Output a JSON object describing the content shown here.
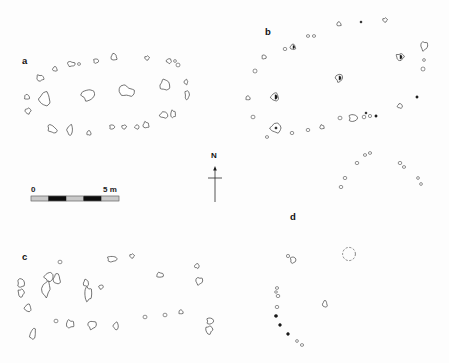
{
  "figure": {
    "kind": "archaeological-site-plan",
    "background_color": "#fdfdfd",
    "outline_color": "#3a3a3a",
    "fill_color": "#ffffff",
    "solid_color": "#1a1a1a"
  },
  "panels": [
    {
      "id": "a",
      "label": "a",
      "label_x": 22,
      "label_y": 64
    },
    {
      "id": "b",
      "label": "b",
      "label_x": 265,
      "label_y": 35
    },
    {
      "id": "c",
      "label": "c",
      "label_x": 22,
      "label_y": 260
    },
    {
      "id": "d",
      "label": "d",
      "label_x": 290,
      "label_y": 220
    }
  ],
  "north_arrow": {
    "label": "N",
    "label_x": 214,
    "label_y": 158,
    "line_x": 215,
    "line_top": 166,
    "line_bottom": 202,
    "cross_y": 178,
    "cross_half_width": 7
  },
  "scale_bar": {
    "left_label": "0",
    "right_label": "5 m",
    "unit": "m",
    "min": 0,
    "max": 5,
    "x": 31,
    "y": 196,
    "width": 88,
    "height": 5,
    "segments": 5,
    "segment_colors": [
      "#c9c9c9",
      "#0d0d0d",
      "#c9c9c9",
      "#0d0d0d",
      "#c9c9c9"
    ],
    "label_left_x": 31,
    "label_right_x": 103,
    "label_y": 192
  },
  "features": {
    "a": [
      {
        "cx": 114,
        "cy": 57,
        "rx": 3.0,
        "ry": 3.3,
        "rot": 0,
        "style": "outline"
      },
      {
        "cx": 96,
        "cy": 61,
        "rx": 2.4,
        "ry": 2.2,
        "rot": 0,
        "style": "outline"
      },
      {
        "cx": 147,
        "cy": 58,
        "rx": 2.2,
        "ry": 2.0,
        "rot": 0,
        "style": "outline"
      },
      {
        "cx": 169,
        "cy": 61,
        "rx": 2.6,
        "ry": 2.2,
        "rot": 15,
        "style": "outline"
      },
      {
        "cx": 175,
        "cy": 61,
        "rx": 1.4,
        "ry": 1.4,
        "rot": 0,
        "style": "outline"
      },
      {
        "cx": 71,
        "cy": 64,
        "rx": 3.6,
        "ry": 2.4,
        "rot": 10,
        "style": "outline"
      },
      {
        "cx": 79,
        "cy": 64,
        "rx": 1.5,
        "ry": 1.4,
        "rot": 0,
        "style": "outline"
      },
      {
        "cx": 55,
        "cy": 69,
        "rx": 2.4,
        "ry": 2.2,
        "rot": 0,
        "style": "outline"
      },
      {
        "cx": 178,
        "cy": 65,
        "rx": 2.0,
        "ry": 1.9,
        "rot": 0,
        "style": "outline"
      },
      {
        "cx": 40,
        "cy": 78,
        "rx": 3.4,
        "ry": 3.0,
        "rot": 20,
        "style": "outline"
      },
      {
        "cx": 186,
        "cy": 82,
        "rx": 1.8,
        "ry": 2.4,
        "rot": 0,
        "style": "outline"
      },
      {
        "cx": 165,
        "cy": 85,
        "rx": 5.0,
        "ry": 5.2,
        "rot": 0,
        "style": "outline"
      },
      {
        "cx": 126,
        "cy": 91,
        "rx": 7.8,
        "ry": 5.0,
        "rot": 20,
        "style": "outline"
      },
      {
        "cx": 88,
        "cy": 95,
        "rx": 6.4,
        "ry": 5.4,
        "rot": 0,
        "style": "outline"
      },
      {
        "cx": 45,
        "cy": 99,
        "rx": 5.6,
        "ry": 6.6,
        "rot": 0,
        "style": "outline"
      },
      {
        "cx": 27,
        "cy": 97,
        "rx": 2.6,
        "ry": 2.4,
        "rot": 0,
        "style": "outline"
      },
      {
        "cx": 187,
        "cy": 95,
        "rx": 2.0,
        "ry": 4.6,
        "rot": 0,
        "style": "outline"
      },
      {
        "cx": 28,
        "cy": 111,
        "rx": 2.8,
        "ry": 2.8,
        "rot": 0,
        "style": "outline"
      },
      {
        "cx": 164,
        "cy": 115,
        "rx": 4.2,
        "ry": 3.0,
        "rot": 0,
        "style": "outline"
      },
      {
        "cx": 173,
        "cy": 114,
        "rx": 2.4,
        "ry": 3.6,
        "rot": 0,
        "style": "outline"
      },
      {
        "cx": 52,
        "cy": 129,
        "rx": 5.0,
        "ry": 3.2,
        "rot": 40,
        "style": "outline"
      },
      {
        "cx": 70,
        "cy": 130,
        "rx": 2.8,
        "ry": 5.0,
        "rot": 5,
        "style": "outline"
      },
      {
        "cx": 89,
        "cy": 133,
        "rx": 2.2,
        "ry": 2.2,
        "rot": 0,
        "style": "outline"
      },
      {
        "cx": 112,
        "cy": 127,
        "rx": 2.4,
        "ry": 2.2,
        "rot": 0,
        "style": "outline"
      },
      {
        "cx": 124,
        "cy": 127,
        "rx": 2.2,
        "ry": 2.0,
        "rot": 0,
        "style": "outline"
      },
      {
        "cx": 137,
        "cy": 127,
        "rx": 2.2,
        "ry": 2.0,
        "rot": 0,
        "style": "outline"
      },
      {
        "cx": 146,
        "cy": 125,
        "rx": 3.0,
        "ry": 3.0,
        "rot": 0,
        "style": "outline"
      }
    ],
    "b": [
      {
        "cx": 339,
        "cy": 24,
        "rx": 2.2,
        "ry": 2.0,
        "rot": 0,
        "style": "outline"
      },
      {
        "cx": 361,
        "cy": 22,
        "rx": 1.0,
        "ry": 1.0,
        "rot": 0,
        "style": "solid"
      },
      {
        "cx": 385,
        "cy": 20,
        "rx": 2.2,
        "ry": 2.0,
        "rot": 0,
        "style": "outline"
      },
      {
        "cx": 308,
        "cy": 36,
        "rx": 1.6,
        "ry": 1.4,
        "rot": 0,
        "style": "outline"
      },
      {
        "cx": 314,
        "cy": 36,
        "rx": 1.6,
        "ry": 1.4,
        "rot": 0,
        "style": "outline"
      },
      {
        "cx": 424,
        "cy": 46,
        "rx": 3.2,
        "ry": 4.4,
        "rot": 0,
        "style": "outline"
      },
      {
        "cx": 285,
        "cy": 49,
        "rx": 1.8,
        "ry": 1.6,
        "rot": 0,
        "style": "outline"
      },
      {
        "cx": 293,
        "cy": 47,
        "rx": 2.8,
        "ry": 2.6,
        "rot": 0,
        "style": "halffill"
      },
      {
        "cx": 264,
        "cy": 57,
        "rx": 2.2,
        "ry": 2.0,
        "rot": 0,
        "style": "outline"
      },
      {
        "cx": 400,
        "cy": 57,
        "rx": 3.6,
        "ry": 3.4,
        "rot": 0,
        "style": "halffill"
      },
      {
        "cx": 424,
        "cy": 60,
        "rx": 1.4,
        "ry": 1.4,
        "rot": 0,
        "style": "outline"
      },
      {
        "cx": 255,
        "cy": 71,
        "rx": 2.0,
        "ry": 2.0,
        "rot": 0,
        "style": "outline"
      },
      {
        "cx": 423,
        "cy": 69,
        "rx": 2.0,
        "ry": 2.0,
        "rot": 0,
        "style": "outline"
      },
      {
        "cx": 339,
        "cy": 78,
        "rx": 3.4,
        "ry": 3.8,
        "rot": 0,
        "style": "halffill"
      },
      {
        "cx": 275,
        "cy": 97,
        "rx": 4.0,
        "ry": 3.8,
        "rot": 0,
        "style": "halffill"
      },
      {
        "cx": 248,
        "cy": 98,
        "rx": 2.2,
        "ry": 2.0,
        "rot": 0,
        "style": "outline"
      },
      {
        "cx": 417,
        "cy": 97,
        "rx": 1.2,
        "ry": 1.2,
        "rot": 0,
        "style": "solid"
      },
      {
        "cx": 253,
        "cy": 117,
        "rx": 2.0,
        "ry": 1.8,
        "rot": 0,
        "style": "outline"
      },
      {
        "cx": 400,
        "cy": 106,
        "rx": 2.6,
        "ry": 2.2,
        "rot": 0,
        "style": "outline"
      },
      {
        "cx": 366,
        "cy": 113,
        "rx": 1.0,
        "ry": 1.0,
        "rot": 0,
        "style": "solid"
      },
      {
        "cx": 364,
        "cy": 117,
        "rx": 1.8,
        "ry": 1.8,
        "rot": 0,
        "style": "outline"
      },
      {
        "cx": 370,
        "cy": 116,
        "rx": 1.6,
        "ry": 1.6,
        "rot": 0,
        "style": "outline"
      },
      {
        "cx": 376,
        "cy": 116,
        "rx": 1.2,
        "ry": 1.2,
        "rot": 0,
        "style": "solid"
      },
      {
        "cx": 353,
        "cy": 118,
        "rx": 4.0,
        "ry": 3.6,
        "rot": 0,
        "style": "outline"
      },
      {
        "cx": 340,
        "cy": 118,
        "rx": 2.0,
        "ry": 1.8,
        "rot": 0,
        "style": "outline"
      },
      {
        "cx": 276,
        "cy": 128,
        "rx": 5.4,
        "ry": 4.6,
        "rot": 0,
        "style": "dotcenter"
      },
      {
        "cx": 322,
        "cy": 127,
        "rx": 2.2,
        "ry": 2.0,
        "rot": 0,
        "style": "outline"
      },
      {
        "cx": 308,
        "cy": 130,
        "rx": 1.8,
        "ry": 1.6,
        "rot": 0,
        "style": "outline"
      },
      {
        "cx": 292,
        "cy": 133,
        "rx": 1.8,
        "ry": 1.6,
        "rot": 0,
        "style": "outline"
      },
      {
        "cx": 267,
        "cy": 137,
        "rx": 1.6,
        "ry": 1.4,
        "rot": 0,
        "style": "outline"
      },
      {
        "cx": 365,
        "cy": 155,
        "rx": 1.6,
        "ry": 1.4,
        "rot": 0,
        "style": "outline"
      },
      {
        "cx": 370,
        "cy": 153,
        "rx": 1.6,
        "ry": 1.4,
        "rot": 0,
        "style": "outline"
      },
      {
        "cx": 357,
        "cy": 163,
        "rx": 1.8,
        "ry": 1.6,
        "rot": 0,
        "style": "outline"
      },
      {
        "cx": 400,
        "cy": 163,
        "rx": 1.8,
        "ry": 1.6,
        "rot": 0,
        "style": "outline"
      },
      {
        "cx": 404,
        "cy": 167,
        "rx": 1.6,
        "ry": 1.4,
        "rot": 0,
        "style": "outline"
      },
      {
        "cx": 345,
        "cy": 178,
        "rx": 1.8,
        "ry": 1.6,
        "rot": 0,
        "style": "outline"
      },
      {
        "cx": 418,
        "cy": 178,
        "rx": 1.4,
        "ry": 1.4,
        "rot": 0,
        "style": "outline"
      },
      {
        "cx": 341,
        "cy": 187,
        "rx": 1.8,
        "ry": 1.6,
        "rot": 0,
        "style": "outline"
      },
      {
        "cx": 421,
        "cy": 184,
        "rx": 1.4,
        "ry": 1.4,
        "rot": 0,
        "style": "outline"
      }
    ],
    "c": [
      {
        "cx": 60,
        "cy": 262,
        "rx": 2.0,
        "ry": 1.8,
        "rot": 0,
        "style": "outline"
      },
      {
        "cx": 112,
        "cy": 259,
        "rx": 4.6,
        "ry": 2.8,
        "rot": 0,
        "style": "outline"
      },
      {
        "cx": 132,
        "cy": 256,
        "rx": 2.2,
        "ry": 2.0,
        "rot": 0,
        "style": "outline"
      },
      {
        "cx": 197,
        "cy": 266,
        "rx": 2.4,
        "ry": 2.2,
        "rot": 0,
        "style": "outline"
      },
      {
        "cx": 160,
        "cy": 275,
        "rx": 3.4,
        "ry": 2.4,
        "rot": 0,
        "style": "outline"
      },
      {
        "cx": 199,
        "cy": 281,
        "rx": 3.2,
        "ry": 3.6,
        "rot": 0,
        "style": "outline"
      },
      {
        "cx": 49,
        "cy": 277,
        "rx": 4.4,
        "ry": 4.4,
        "rot": 0,
        "style": "outline"
      },
      {
        "cx": 57,
        "cy": 279,
        "rx": 3.6,
        "ry": 5.0,
        "rot": 0,
        "style": "outline"
      },
      {
        "cx": 21,
        "cy": 283,
        "rx": 3.4,
        "ry": 4.4,
        "rot": 0,
        "style": "outline"
      },
      {
        "cx": 21,
        "cy": 293,
        "rx": 2.8,
        "ry": 4.0,
        "rot": 0,
        "style": "outline"
      },
      {
        "cx": 46,
        "cy": 289,
        "rx": 4.0,
        "ry": 7.4,
        "rot": 8,
        "style": "outline"
      },
      {
        "cx": 86,
        "cy": 283,
        "rx": 2.6,
        "ry": 3.4,
        "rot": 0,
        "style": "outline"
      },
      {
        "cx": 88,
        "cy": 294,
        "rx": 3.4,
        "ry": 7.0,
        "rot": 0,
        "style": "outline"
      },
      {
        "cx": 101,
        "cy": 287,
        "rx": 2.2,
        "ry": 2.0,
        "rot": 0,
        "style": "outline"
      },
      {
        "cx": 28,
        "cy": 308,
        "rx": 3.4,
        "ry": 3.6,
        "rot": 0,
        "style": "outline"
      },
      {
        "cx": 181,
        "cy": 312,
        "rx": 2.2,
        "ry": 2.0,
        "rot": 0,
        "style": "outline"
      },
      {
        "cx": 165,
        "cy": 315,
        "rx": 2.0,
        "ry": 1.8,
        "rot": 0,
        "style": "outline"
      },
      {
        "cx": 145,
        "cy": 317,
        "rx": 2.0,
        "ry": 1.8,
        "rot": 0,
        "style": "outline"
      },
      {
        "cx": 56,
        "cy": 321,
        "rx": 2.0,
        "ry": 1.8,
        "rot": 0,
        "style": "outline"
      },
      {
        "cx": 70,
        "cy": 324,
        "rx": 3.8,
        "ry": 3.8,
        "rot": 0,
        "style": "outline"
      },
      {
        "cx": 92,
        "cy": 325,
        "rx": 4.0,
        "ry": 4.0,
        "rot": 0,
        "style": "outline"
      },
      {
        "cx": 116,
        "cy": 326,
        "rx": 2.6,
        "ry": 3.6,
        "rot": 0,
        "style": "outline"
      },
      {
        "cx": 33,
        "cy": 334,
        "rx": 2.8,
        "ry": 5.4,
        "rot": 15,
        "style": "outline"
      },
      {
        "cx": 210,
        "cy": 321,
        "rx": 3.2,
        "ry": 3.2,
        "rot": 0,
        "style": "outline"
      },
      {
        "cx": 209,
        "cy": 330,
        "rx": 3.2,
        "ry": 4.0,
        "rot": 0,
        "style": "outline"
      }
    ],
    "d": [
      {
        "cx": 288,
        "cy": 256,
        "rx": 1.6,
        "ry": 1.6,
        "rot": 0,
        "style": "outline"
      },
      {
        "cx": 293,
        "cy": 260,
        "rx": 2.6,
        "ry": 3.2,
        "rot": 0,
        "style": "outline"
      },
      {
        "cx": 349,
        "cy": 254,
        "rx": 6.4,
        "ry": 6.6,
        "rot": 0,
        "style": "dashed"
      },
      {
        "cx": 277,
        "cy": 288,
        "rx": 1.6,
        "ry": 1.4,
        "rot": 0,
        "style": "outline"
      },
      {
        "cx": 276,
        "cy": 292,
        "rx": 1.4,
        "ry": 1.2,
        "rot": 0,
        "style": "outline"
      },
      {
        "cx": 278,
        "cy": 296,
        "rx": 1.8,
        "ry": 1.6,
        "rot": 0,
        "style": "outline"
      },
      {
        "cx": 277,
        "cy": 307,
        "rx": 1.8,
        "ry": 1.6,
        "rot": 0,
        "style": "outline"
      },
      {
        "cx": 325,
        "cy": 304,
        "rx": 2.4,
        "ry": 3.2,
        "rot": 0,
        "style": "outline"
      },
      {
        "cx": 276,
        "cy": 316,
        "rx": 1.6,
        "ry": 1.4,
        "rot": 0,
        "style": "solid"
      },
      {
        "cx": 280,
        "cy": 325,
        "rx": 1.4,
        "ry": 1.4,
        "rot": 0,
        "style": "solid"
      },
      {
        "cx": 288,
        "cy": 334,
        "rx": 1.4,
        "ry": 1.4,
        "rot": 0,
        "style": "solid"
      },
      {
        "cx": 297,
        "cy": 341,
        "rx": 1.4,
        "ry": 1.4,
        "rot": 0,
        "style": "outline"
      },
      {
        "cx": 302,
        "cy": 345,
        "rx": 1.6,
        "ry": 1.4,
        "rot": 0,
        "style": "outline"
      }
    ]
  }
}
